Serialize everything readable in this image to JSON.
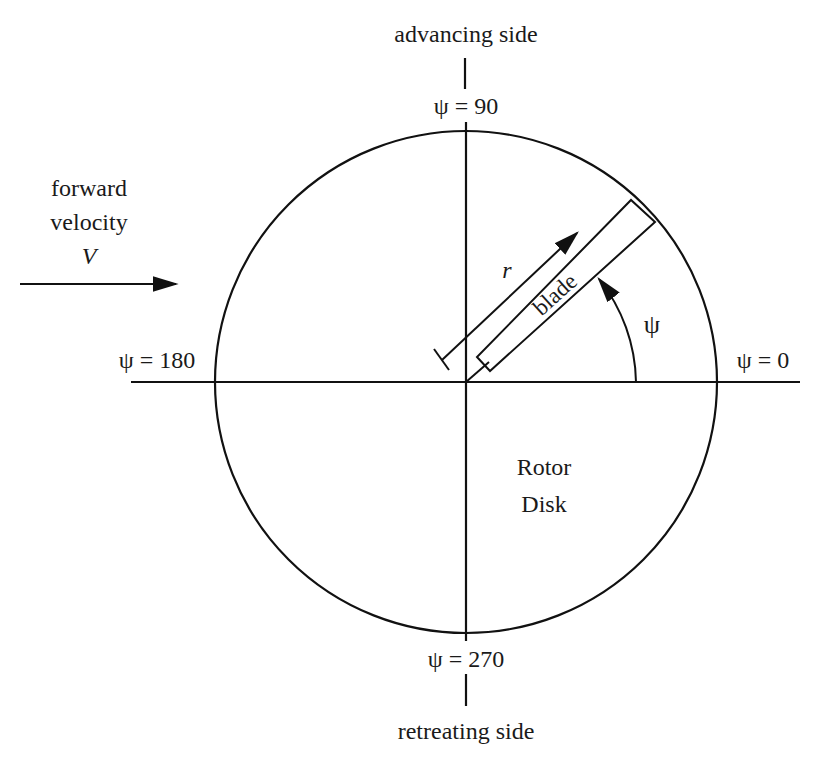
{
  "diagram": {
    "labels": {
      "top": "advancing side",
      "bottom": "retreating side",
      "forward_line1": "forward",
      "forward_line2": "velocity",
      "forward_symbol": "V",
      "psi_90": "ψ = 90",
      "psi_180": "ψ = 180",
      "psi_0": "ψ = 0",
      "psi_270": "ψ = 270",
      "psi_angle": "ψ",
      "radius": "r",
      "blade": "blade",
      "disk_line1": "Rotor",
      "disk_line2": "Disk"
    },
    "colors": {
      "stroke": "#111111",
      "text": "#1a1a1a",
      "background": "#ffffff"
    }
  }
}
